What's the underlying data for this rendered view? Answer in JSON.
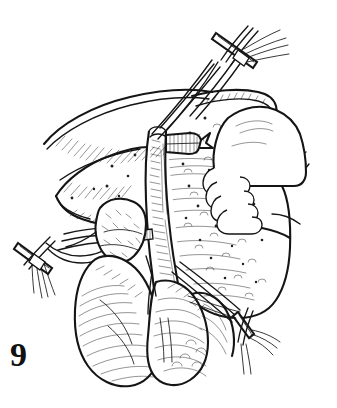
{
  "figure": {
    "number": "9",
    "caption_number": "9",
    "kind": "surgical line drawing",
    "background_color": "#ffffff",
    "ink_color": "#151515",
    "width_px": 337,
    "height_px": 408
  },
  "labels": {
    "figure_number_text": "9"
  },
  "structures": [
    {
      "name": "inferior-vena-cava",
      "description": "vertical tubular vessel running down the centre of the field"
    },
    {
      "name": "ligated-lumbar-branch",
      "description": "short sutured vessel stump directed to the right of the cava"
    },
    {
      "name": "suture-line-on-cava",
      "description": "running suture hatching along the anterior wall of the cava"
    },
    {
      "name": "upper-vessel-loop-tie",
      "description": "crossed suture tie with free tails at the top right"
    },
    {
      "name": "left-vessel-loop-tie",
      "description": "crossed suture tie with free tails at the middle left"
    },
    {
      "name": "lower-right-suture-tails",
      "description": "pair of suture strands drawn to the lower right"
    },
    {
      "name": "liver-edge",
      "description": "hatched organ margin sweeping across the upper left"
    },
    {
      "name": "tissue-flap",
      "description": "stippled soft-tissue flap on the right being retracted"
    },
    {
      "name": "surgeons-hand",
      "description": "gloved hand with four fingers retracting the tissue flap"
    },
    {
      "name": "adrenal-gland",
      "description": "small lobulated gland left of the cava"
    },
    {
      "name": "kidney-left",
      "description": "large reniform organ at lower left"
    },
    {
      "name": "kidney-right",
      "description": "second reniform organ at lower centre-right"
    }
  ],
  "colors": {
    "ink": "#151515",
    "paper": "#ffffff",
    "stipple": "#202020"
  }
}
